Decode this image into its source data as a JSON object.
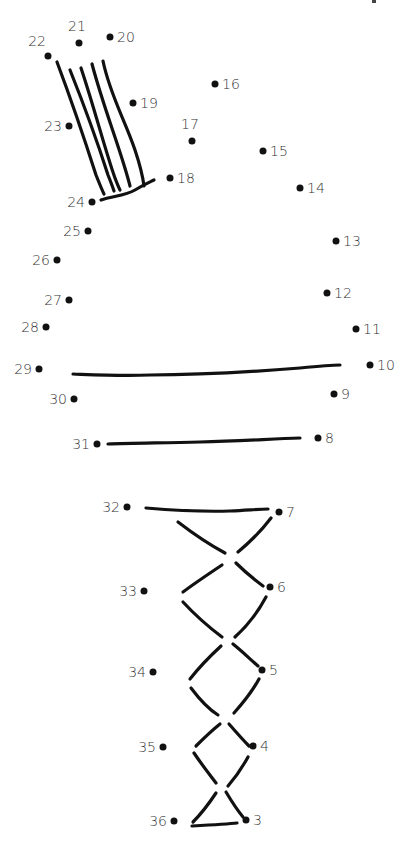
{
  "puzzle": {
    "type": "connect-the-dots",
    "dot_color": "#111111",
    "label_color": "#333333",
    "dots": [
      {
        "n": "3",
        "x": 246,
        "y": 820,
        "pos": "right"
      },
      {
        "n": "4",
        "x": 253,
        "y": 746,
        "pos": "right"
      },
      {
        "n": "5",
        "x": 262,
        "y": 670,
        "pos": "right"
      },
      {
        "n": "6",
        "x": 270,
        "y": 587,
        "pos": "right"
      },
      {
        "n": "7",
        "x": 279,
        "y": 512,
        "pos": "right"
      },
      {
        "n": "8",
        "x": 318,
        "y": 438,
        "pos": "right"
      },
      {
        "n": "9",
        "x": 334,
        "y": 394,
        "pos": "right"
      },
      {
        "n": "10",
        "x": 370,
        "y": 365,
        "pos": "right"
      },
      {
        "n": "11",
        "x": 356,
        "y": 329,
        "pos": "right"
      },
      {
        "n": "12",
        "x": 327,
        "y": 293,
        "pos": "right"
      },
      {
        "n": "13",
        "x": 336,
        "y": 241,
        "pos": "right"
      },
      {
        "n": "14",
        "x": 300,
        "y": 188,
        "pos": "right"
      },
      {
        "n": "15",
        "x": 263,
        "y": 151,
        "pos": "right"
      },
      {
        "n": "16",
        "x": 215,
        "y": 84,
        "pos": "right"
      },
      {
        "n": "17",
        "x": 192,
        "y": 141,
        "pos": "above"
      },
      {
        "n": "18",
        "x": 170,
        "y": 178,
        "pos": "right"
      },
      {
        "n": "19",
        "x": 133,
        "y": 103,
        "pos": "right"
      },
      {
        "n": "20",
        "x": 110,
        "y": 37,
        "pos": "right"
      },
      {
        "n": "21",
        "x": 79,
        "y": 43,
        "pos": "above"
      },
      {
        "n": "22",
        "x": 48,
        "y": 56,
        "pos": "above-left"
      },
      {
        "n": "23",
        "x": 69,
        "y": 126,
        "pos": "left"
      },
      {
        "n": "24",
        "x": 92,
        "y": 202,
        "pos": "left"
      },
      {
        "n": "25",
        "x": 88,
        "y": 231,
        "pos": "left"
      },
      {
        "n": "26",
        "x": 57,
        "y": 260,
        "pos": "left"
      },
      {
        "n": "27",
        "x": 69,
        "y": 300,
        "pos": "left"
      },
      {
        "n": "28",
        "x": 46,
        "y": 327,
        "pos": "left"
      },
      {
        "n": "29",
        "x": 39,
        "y": 369,
        "pos": "left"
      },
      {
        "n": "30",
        "x": 74,
        "y": 399,
        "pos": "left"
      },
      {
        "n": "31",
        "x": 97,
        "y": 444,
        "pos": "left"
      },
      {
        "n": "32",
        "x": 127,
        "y": 507,
        "pos": "left"
      },
      {
        "n": "33",
        "x": 144,
        "y": 591,
        "pos": "left"
      },
      {
        "n": "34",
        "x": 153,
        "y": 672,
        "pos": "left"
      },
      {
        "n": "35",
        "x": 163,
        "y": 747,
        "pos": "left"
      },
      {
        "n": "36",
        "x": 174,
        "y": 821,
        "pos": "left"
      }
    ],
    "strokes": [
      "M57 62 C75 110, 88 150, 96 175 C100 185, 102 190, 104 194",
      "M70 70 C88 115, 100 150, 108 175 C112 185, 113 188, 114 191",
      "M81 68 C95 110, 105 150, 115 178 C118 186, 119 188, 120 190",
      "M92 64 C103 105, 115 135, 124 165 C128 178, 129 182, 130 186",
      "M103 61 C110 95, 125 120, 135 150 C140 165, 143 178, 144 186",
      "M101 200 C112 196, 125 196, 135 190 C145 184, 150 182, 154 180",
      "M73 374 C100 375, 120 376, 150 375 C200 375, 250 372, 300 368 C320 366, 330 365, 340 365",
      "M108 444 C130 443, 160 443, 200 442 C240 441, 270 439, 300 438",
      "M146 508 C170 510, 200 512, 230 511 C250 510, 260 509, 268 509",
      "M178 522 C195 535, 210 545, 225 553",
      "M271 518 C262 530, 250 542, 238 552",
      "M222 565 C210 573, 195 583, 183 592",
      "M236 563 C245 572, 255 580, 263 586",
      "M183 602 C195 615, 210 628, 222 637",
      "M266 597 C258 612, 247 626, 235 637",
      "M221 646 C208 658, 197 670, 190 679",
      "M233 644 C243 652, 251 660, 258 666",
      "M191 688 C200 700, 210 710, 218 715",
      "M259 679 C252 692, 242 704, 234 713",
      "M220 724 C210 732, 202 740, 196 746",
      "M229 724 C236 732, 243 740, 249 746",
      "M194 753 C202 765, 210 775, 216 783",
      "M248 757 C242 768, 235 778, 228 786",
      "M216 793 C208 805, 200 815, 193 822",
      "M226 792 C232 802, 238 811, 243 817",
      "M192 826 C210 825, 228 824, 237 823"
    ]
  }
}
